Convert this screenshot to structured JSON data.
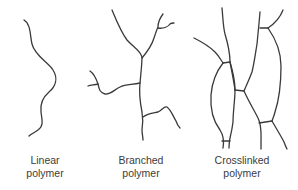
{
  "diagram": {
    "title": "",
    "panels": [
      {
        "id": "linear",
        "label_line1": "Linear",
        "label_line2": "polymer"
      },
      {
        "id": "branched",
        "label_line1": "Branched",
        "label_line2": "polymer"
      },
      {
        "id": "crosslinked",
        "label_line1": "Crosslinked",
        "label_line2": "polymer"
      }
    ],
    "colors": {
      "line": "#3a3a3a",
      "text": "#3c3c3c",
      "background": "#ffffff"
    }
  }
}
